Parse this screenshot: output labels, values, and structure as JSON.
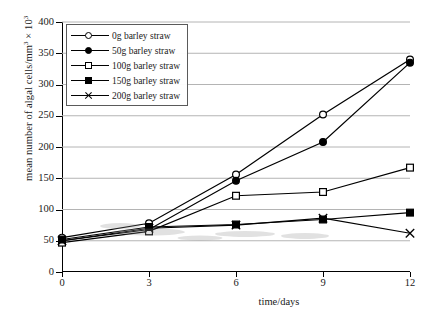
{
  "chart_data": {
    "type": "line",
    "title": "",
    "xlabel": "time/days",
    "ylabel": "mean number of algal cells/mm3 × 103",
    "ylabel_main": "mean number of algal cells/mm",
    "ylabel_sup1": "3",
    "ylabel_mid": " × 10",
    "ylabel_sup2": "3",
    "x": [
      0,
      3,
      6,
      9,
      12
    ],
    "xlim": [
      0,
      12
    ],
    "ylim": [
      0,
      400
    ],
    "xticks": [
      "0",
      "3",
      "6",
      "9",
      "12"
    ],
    "yticks": [
      "0",
      "50",
      "100",
      "150",
      "200",
      "250",
      "300",
      "350",
      "400"
    ],
    "grid": "horizontal",
    "legend_position": "top-left",
    "series": [
      {
        "name": "0g barley straw",
        "marker": "open-circle",
        "values": [
          55,
          78,
          156,
          252,
          340
        ]
      },
      {
        "name": "50g barley straw",
        "marker": "filled-circle",
        "values": [
          50,
          68,
          146,
          208,
          335
        ]
      },
      {
        "name": "100g barley straw",
        "marker": "open-square",
        "values": [
          47,
          65,
          122,
          128,
          167
        ]
      },
      {
        "name": "150g barley straw",
        "marker": "filled-square",
        "values": [
          52,
          72,
          76,
          84,
          95
        ]
      },
      {
        "name": "200g barley straw",
        "marker": "cross",
        "values": [
          50,
          70,
          75,
          86,
          62
        ]
      }
    ]
  },
  "legend": {
    "items": [
      {
        "label": "0g barley straw",
        "marker": "open-circle"
      },
      {
        "label": "50g barley straw",
        "marker": "filled-circle"
      },
      {
        "label": "100g barley straw",
        "marker": "open-square"
      },
      {
        "label": "150g barley straw",
        "marker": "filled-square"
      },
      {
        "label": "200g barley straw",
        "marker": "cross"
      }
    ]
  },
  "colors": {
    "line": "#000000",
    "grid": "#b4b4b4",
    "axis": "#000000",
    "background": "#ffffff"
  }
}
